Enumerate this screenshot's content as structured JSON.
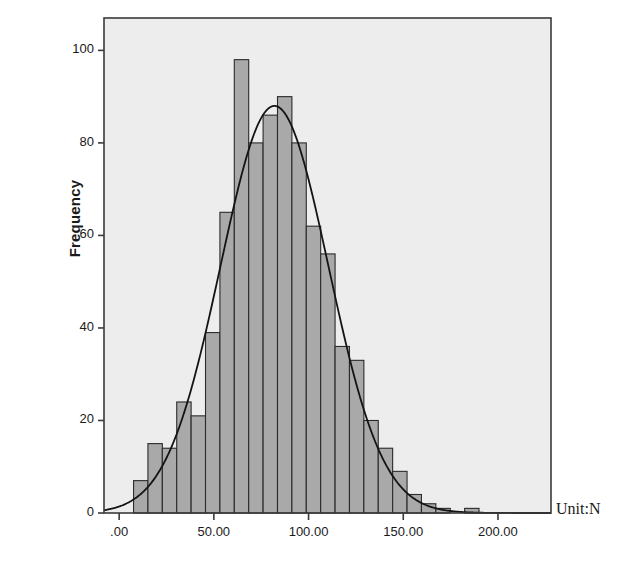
{
  "chart_data": {
    "type": "bar",
    "title": "",
    "subtitle": "",
    "xlabel": "",
    "ylabel": "Frequency",
    "unit_annotation": "Unit:N",
    "grid": false,
    "legend": null,
    "xlim": [
      -8,
      228
    ],
    "ylim": [
      0,
      107
    ],
    "xticks": [
      0,
      50,
      100,
      150,
      200
    ],
    "xtick_labels": [
      ".00",
      "50.00",
      "100.00",
      "150.00",
      "200.00"
    ],
    "yticks": [
      0,
      20,
      40,
      60,
      80,
      100
    ],
    "ytick_labels": [
      "0",
      "20",
      "40",
      "60",
      "80",
      "100"
    ],
    "bin_width": 7.6,
    "bin_starts": [
      7.6,
      15.2,
      22.8,
      30.4,
      38.0,
      45.6,
      53.2,
      60.8,
      68.4,
      76.0,
      83.6,
      91.2,
      98.8,
      106.4,
      114.0,
      121.6,
      129.2,
      136.8,
      144.4,
      152.0,
      159.6,
      167.2,
      182.4
    ],
    "values": [
      7,
      15,
      14,
      24,
      21,
      39,
      65,
      98,
      80,
      86,
      90,
      80,
      62,
      56,
      36,
      33,
      20,
      14,
      9,
      4,
      2,
      1,
      1
    ],
    "overlay_curve": {
      "name": "normal-distribution-curve",
      "type": "line",
      "mean": 82,
      "std_dev": 28.5,
      "peak_value": 88
    },
    "colors": {
      "bar_fill": "#a9a9a9",
      "bar_edge": "#2b2b2b",
      "curve": "#141414",
      "plot_background": "#ededed",
      "frame": "#3a3a3a",
      "text": "#1a1a1a"
    }
  }
}
